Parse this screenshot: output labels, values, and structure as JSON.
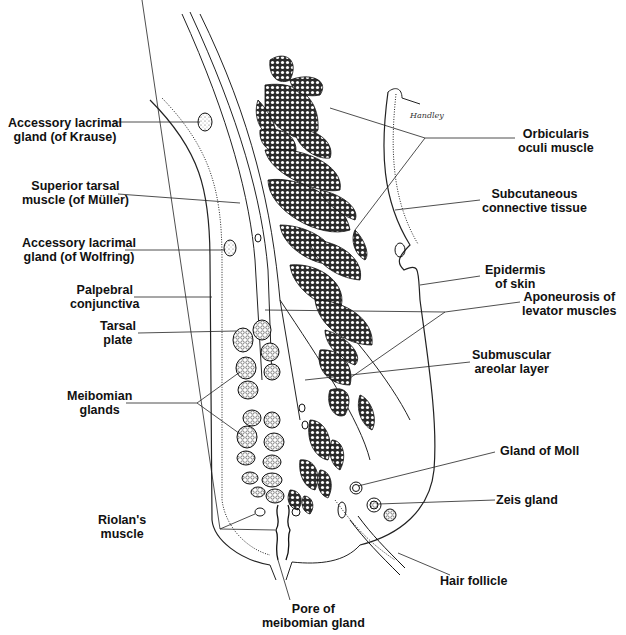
{
  "diagram": {
    "signature": "Handley",
    "colors": {
      "ink": "#111111",
      "background": "#ffffff",
      "muscle_fill": "#3a3a3a"
    }
  },
  "labels_left": [
    {
      "id": "krause",
      "line1": "Accessory lacrimal",
      "line2": "gland (of Krause)"
    },
    {
      "id": "muller",
      "line1": "Superior tarsal",
      "line2": "muscle (of Müller)"
    },
    {
      "id": "wolfring",
      "line1": "Accessory lacrimal",
      "line2": "gland (of Wolfring)"
    },
    {
      "id": "conjunctiva",
      "line1": "Palpebral",
      "line2": "conjunctiva"
    },
    {
      "id": "tarsal",
      "line1": "Tarsal",
      "line2": "plate"
    },
    {
      "id": "meibomian",
      "line1": "Meibomian",
      "line2": "glands"
    },
    {
      "id": "riolan",
      "line1": "Riolan's",
      "line2": "muscle"
    }
  ],
  "labels_right": [
    {
      "id": "orbicularis",
      "line1": "Orbicularis",
      "line2": "oculi muscle"
    },
    {
      "id": "subcutaneous",
      "line1": "Subcutaneous",
      "line2": "connective tissue"
    },
    {
      "id": "epidermis",
      "line1": "Epidermis",
      "line2": "of skin"
    },
    {
      "id": "aponeurosis",
      "line1": "Aponeurosis of",
      "line2": "levator muscles"
    },
    {
      "id": "submuscular",
      "line1": "Submuscular",
      "line2": "areolar layer"
    },
    {
      "id": "moll",
      "line1": "Gland of Moll",
      "line2": ""
    },
    {
      "id": "zeis",
      "line1": "Zeis gland",
      "line2": ""
    },
    {
      "id": "follicle",
      "line1": "Hair follicle",
      "line2": ""
    }
  ],
  "labels_bottom": [
    {
      "id": "pore",
      "line1": "Pore of",
      "line2": "meibomian gland"
    }
  ]
}
